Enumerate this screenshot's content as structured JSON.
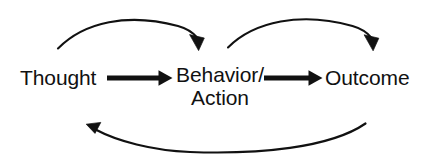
{
  "diagram": {
    "type": "cycle-flow-diagram",
    "canvas": {
      "width": 430,
      "height": 161,
      "background": "#ffffff"
    },
    "stroke_color": "#111111",
    "text_color": "#111111",
    "nodes": [
      {
        "id": "thought",
        "label": "Thought",
        "x": 20,
        "y": 67
      },
      {
        "id": "behavior-action",
        "label_line_1": "Behavior/",
        "label_line_2": "Action",
        "x": 172,
        "y": 64
      },
      {
        "id": "outcome",
        "label": "Outcome",
        "x": 325,
        "y": 67
      }
    ],
    "connectors": [
      {
        "id": "thought-to-behavior",
        "kind": "straight-arrow",
        "from": "thought",
        "to": "behavior-action",
        "from_point": [
          107,
          78
        ],
        "to_point": [
          172,
          78
        ],
        "arrowhead": "end",
        "thickness": 5
      },
      {
        "id": "behavior-to-outcome",
        "kind": "straight-arrow",
        "from": "behavior-action",
        "to": "outcome",
        "from_point": [
          263,
          78
        ],
        "to_point": [
          322,
          78
        ],
        "arrowhead": "end",
        "thickness": 5
      },
      {
        "id": "thought-to-behavior-curve",
        "kind": "curved-arrow-above",
        "from": "thought",
        "to": "behavior-action",
        "from_point": [
          58,
          48
        ],
        "to_point": [
          198,
          50
        ],
        "peak_y": 18,
        "arrowhead": "end",
        "thickness": 2
      },
      {
        "id": "behavior-to-outcome-curve",
        "kind": "curved-arrow-above",
        "from": "behavior-action",
        "to": "outcome",
        "from_point": [
          228,
          47
        ],
        "to_point": [
          373,
          50
        ],
        "peak_y": 18,
        "arrowhead": "end",
        "thickness": 2
      },
      {
        "id": "outcome-to-thought-curve",
        "kind": "curved-arrow-below",
        "from": "outcome",
        "to": "thought",
        "from_point": [
          365,
          124
        ],
        "to_point": [
          87,
          125
        ],
        "trough_y": 150,
        "arrowhead": "end",
        "thickness": 2
      }
    ]
  }
}
